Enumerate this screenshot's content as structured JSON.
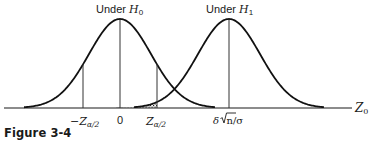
{
  "figure": {
    "caption": "Figure 3-4",
    "labels": {
      "h0_title_prefix": "Under ",
      "h0_title_symbol": "H",
      "h0_title_sub": "0",
      "h1_title_prefix": "Under ",
      "h1_title_symbol": "H",
      "h1_title_sub": "1",
      "neg_z_prefix": "−Z",
      "neg_z_sub": "α/2",
      "zero": "0",
      "pos_z_prefix": "Z",
      "pos_z_sub": "α/2",
      "shift_label_delta": "δ",
      "shift_label_rest": "n/σ",
      "axis_label": "Z",
      "axis_label_sub": "0"
    }
  },
  "chart_data": {
    "type": "area",
    "title": "",
    "xlabel": "Z0",
    "ylabel": "",
    "grid": false,
    "legend": "none",
    "series": [
      {
        "name": "Under H0",
        "distribution": "normal",
        "mean": 0,
        "sd": 1
      },
      {
        "name": "Under H1",
        "distribution": "normal",
        "mean": "δ√n/σ",
        "sd": 1
      }
    ],
    "x_tick_labels": [
      "−Z_{α/2}",
      "0",
      "Z_{α/2}",
      "δ√n/σ"
    ],
    "vertical_lines": [
      "−Z_{α/2}",
      "0",
      "Z_{α/2}",
      "δ√n/σ"
    ],
    "shaded_region": {
      "description": "Area under H1 curve between −Z_{α/2} and Z_{α/2} (Type II error β)",
      "from": "−Z_{α/2}",
      "to": "Z_{α/2}",
      "under_series": "Under H1"
    },
    "annotations": [
      "Under H0",
      "Under H1"
    ]
  }
}
